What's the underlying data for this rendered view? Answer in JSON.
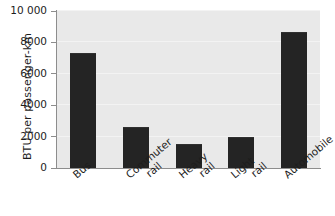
{
  "chart_data": {
    "type": "bar",
    "title": "",
    "subtitle": "",
    "xlabel": "",
    "ylabel": "BTU per passenger-km",
    "categories": [
      "Bus",
      "Commuter rail",
      "Heavy rail",
      "Light rail",
      "Automobile"
    ],
    "values": [
      7300,
      2600,
      1500,
      1950,
      8650
    ],
    "ylim": [
      0,
      10000
    ],
    "ytick_values": [
      0,
      2000,
      4000,
      6000,
      8000,
      10000
    ],
    "ytick_labels": [
      "0",
      "2000",
      "4000",
      "6000",
      "8000",
      "10 000"
    ],
    "grid": true,
    "legend": false,
    "legend_position": "none",
    "bar_color": "#242424",
    "panel_color": "#e9e9e9",
    "axis_color": "#8d8d8d",
    "text_color": "#1d1d1d"
  },
  "axis": {
    "y_title": "BTU per passenger-km"
  },
  "categories": [
    {
      "label": "Bus",
      "line1": "Bus",
      "line2": ""
    },
    {
      "label": "Commuter rail",
      "line1": "Commuter",
      "line2": "rail"
    },
    {
      "label": "Heavy rail",
      "line1": "Heavy",
      "line2": "rail"
    },
    {
      "label": "Light rail",
      "line1": "Light",
      "line2": "rail"
    },
    {
      "label": "Automobile",
      "line1": "Automobile",
      "line2": ""
    }
  ],
  "yticks": [
    {
      "label": "10 000",
      "value": 10000
    },
    {
      "label": "8000",
      "value": 8000
    },
    {
      "label": "6000",
      "value": 6000
    },
    {
      "label": "4000",
      "value": 4000
    },
    {
      "label": "2000",
      "value": 2000
    },
    {
      "label": "0",
      "value": 0
    }
  ]
}
